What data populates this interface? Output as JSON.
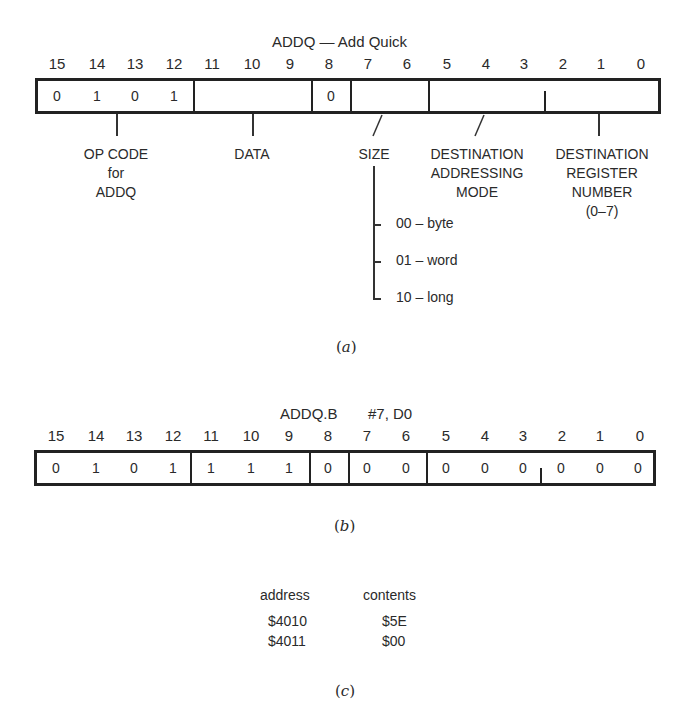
{
  "figure_a": {
    "title": "ADDQ — Add Quick",
    "bit_numbers": [
      "15",
      "14",
      "13",
      "12",
      "11",
      "10",
      "9",
      "8",
      "7",
      "6",
      "5",
      "4",
      "3",
      "2",
      "1",
      "0"
    ],
    "bit_values": {
      "b15": "0",
      "b14": "1",
      "b13": "0",
      "b12": "1",
      "b8": "0"
    },
    "fields": {
      "opcode": [
        "OP CODE",
        "for",
        "ADDQ"
      ],
      "data": "DATA",
      "size": "SIZE",
      "dest_mode": [
        "DESTINATION",
        "ADDRESSING",
        "MODE"
      ],
      "dest_reg": [
        "DESTINATION",
        "REGISTER",
        "NUMBER",
        "(0–7)"
      ]
    },
    "size_options": [
      "00 – byte",
      "01 – word",
      "10 – long"
    ],
    "caption_open": "(",
    "caption_letter": "a",
    "caption_close": ")"
  },
  "figure_b": {
    "title_mnemonic": "ADDQ.B",
    "title_operands": "#7, D0",
    "bit_numbers": [
      "15",
      "14",
      "13",
      "12",
      "11",
      "10",
      "9",
      "8",
      "7",
      "6",
      "5",
      "4",
      "3",
      "2",
      "1",
      "0"
    ],
    "bit_values": [
      "0",
      "1",
      "0",
      "1",
      "1",
      "1",
      "1",
      "0",
      "0",
      "0",
      "0",
      "0",
      "0",
      "0",
      "0",
      "0"
    ],
    "caption_open": "(",
    "caption_letter": "b",
    "caption_close": ")"
  },
  "figure_c": {
    "headers": {
      "address": "address",
      "contents": "contents"
    },
    "rows": [
      {
        "address": "$4010",
        "contents": "$5E"
      },
      {
        "address": "$4011",
        "contents": "$00"
      }
    ],
    "caption_open": "(",
    "caption_letter": "c",
    "caption_close": ")"
  }
}
